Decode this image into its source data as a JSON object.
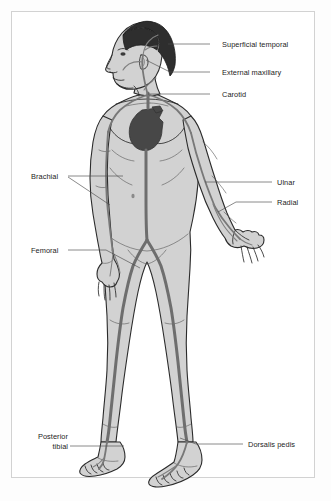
{
  "diagram": {
    "colors": {
      "page_background": "#fdfdfd",
      "frame_background": "#ffffff",
      "frame_border": "#d2d2d2",
      "body_fill": "#d2d2d2",
      "body_outline": "#2b2b2b",
      "artery": "#6e6e6e",
      "heart": "#474747",
      "hair": "#2e2e2e",
      "leader_line": "#4a4a4a",
      "label_text": "#1d1d1d"
    },
    "labels": [
      {
        "id": "superficial-temporal",
        "text": "Superficial temporal",
        "side": "right",
        "x": 222,
        "y": 40,
        "leader": {
          "x1": 210,
          "y1": 44,
          "x2": 168,
          "y2": 44
        }
      },
      {
        "id": "external-maxillary",
        "text": "External maxillary",
        "side": "right",
        "x": 222,
        "y": 68,
        "leader": {
          "x1": 210,
          "y1": 72,
          "x2": 146,
          "y2": 60
        }
      },
      {
        "id": "carotid",
        "text": "Carotid",
        "side": "right",
        "x": 222,
        "y": 90,
        "leader": {
          "x1": 210,
          "y1": 94,
          "x2": 148,
          "y2": 94
        }
      },
      {
        "id": "brachial",
        "text": "Brachial",
        "side": "left",
        "x": 31,
        "y": 172,
        "leader": {
          "x1": 68,
          "y1": 176,
          "x2": 123,
          "y2": 176
        }
      },
      {
        "id": "ulnar",
        "text": "Ulnar",
        "side": "right",
        "x": 277,
        "y": 178,
        "leader": {
          "x1": 272,
          "y1": 182,
          "x2": 205,
          "y2": 182
        }
      },
      {
        "id": "radial",
        "text": "Radial",
        "side": "right",
        "x": 277,
        "y": 198,
        "leader": {
          "x1": 272,
          "y1": 202,
          "x2": 222,
          "y2": 212
        }
      },
      {
        "id": "femoral",
        "text": "Femoral",
        "side": "left",
        "x": 31,
        "y": 246,
        "leader": {
          "x1": 68,
          "y1": 250,
          "x2": 140,
          "y2": 262
        }
      },
      {
        "id": "posterior-tibial",
        "line1": "Posterior",
        "line2": "tibial",
        "text": "Posterior tibial",
        "side": "left",
        "x": 26,
        "y": 432,
        "leader": {
          "x1": 70,
          "y1": 446,
          "x2": 124,
          "y2": 446
        }
      },
      {
        "id": "dorsalis-pedis",
        "text": "Dorsalis pedis",
        "side": "right",
        "x": 248,
        "y": 440,
        "leader": {
          "x1": 243,
          "y1": 444,
          "x2": 180,
          "y2": 440
        }
      }
    ],
    "arteries": [
      "superficial temporal",
      "external maxillary",
      "carotid",
      "brachial",
      "ulnar",
      "radial",
      "femoral",
      "posterior tibial",
      "dorsalis pedis"
    ]
  }
}
